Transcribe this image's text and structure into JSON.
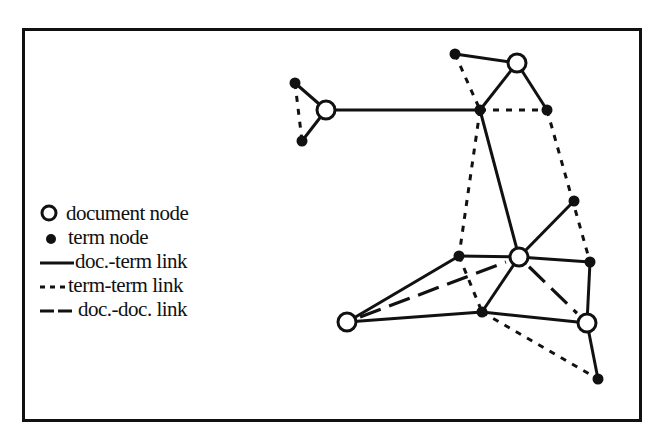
{
  "figure": {
    "type": "term-document graph",
    "legend": {
      "items": [
        {
          "symbol": "open-circle",
          "label": "document node"
        },
        {
          "symbol": "filled-dot",
          "label": "term node"
        },
        {
          "symbol": "solid-line",
          "label": "doc.-term link"
        },
        {
          "symbol": "short-dash-line",
          "label": "term-term link"
        },
        {
          "symbol": "long-dash-line",
          "label": "doc.-doc. link"
        }
      ]
    },
    "colors": {
      "ink": "#111111",
      "background": "#ffffff"
    },
    "nodes": [
      {
        "id": "d1",
        "kind": "document",
        "x": 326,
        "y": 110
      },
      {
        "id": "d2",
        "kind": "document",
        "x": 517,
        "y": 63
      },
      {
        "id": "d3",
        "kind": "document",
        "x": 519,
        "y": 257
      },
      {
        "id": "d4",
        "kind": "document",
        "x": 347,
        "y": 322
      },
      {
        "id": "d5",
        "kind": "document",
        "x": 587,
        "y": 323
      },
      {
        "id": "t1",
        "kind": "term",
        "x": 295,
        "y": 83
      },
      {
        "id": "t2",
        "kind": "term",
        "x": 302,
        "y": 141
      },
      {
        "id": "t3",
        "kind": "term",
        "x": 455,
        "y": 54
      },
      {
        "id": "t4",
        "kind": "term",
        "x": 480,
        "y": 110
      },
      {
        "id": "t5",
        "kind": "term",
        "x": 547,
        "y": 110
      },
      {
        "id": "t6",
        "kind": "term",
        "x": 574,
        "y": 201
      },
      {
        "id": "t7",
        "kind": "term",
        "x": 459,
        "y": 256
      },
      {
        "id": "t8",
        "kind": "term",
        "x": 590,
        "y": 262
      },
      {
        "id": "t9",
        "kind": "term",
        "x": 482,
        "y": 312
      },
      {
        "id": "t10",
        "kind": "term",
        "x": 598,
        "y": 379
      }
    ],
    "edges": [
      {
        "from": "d1",
        "to": "t1",
        "type": "doc-term"
      },
      {
        "from": "d1",
        "to": "t2",
        "type": "doc-term"
      },
      {
        "from": "d1",
        "to": "t4",
        "type": "doc-term"
      },
      {
        "from": "d2",
        "to": "t3",
        "type": "doc-term"
      },
      {
        "from": "d2",
        "to": "t4",
        "type": "doc-term"
      },
      {
        "from": "d2",
        "to": "t5",
        "type": "doc-term"
      },
      {
        "from": "d3",
        "to": "t4",
        "type": "doc-term"
      },
      {
        "from": "d3",
        "to": "t6",
        "type": "doc-term"
      },
      {
        "from": "d3",
        "to": "t7",
        "type": "doc-term"
      },
      {
        "from": "d3",
        "to": "t8",
        "type": "doc-term"
      },
      {
        "from": "d3",
        "to": "t9",
        "type": "doc-term"
      },
      {
        "from": "d4",
        "to": "t7",
        "type": "doc-term"
      },
      {
        "from": "d4",
        "to": "t9",
        "type": "doc-term"
      },
      {
        "from": "d5",
        "to": "t9",
        "type": "doc-term"
      },
      {
        "from": "d5",
        "to": "t8",
        "type": "doc-term"
      },
      {
        "from": "d5",
        "to": "t10",
        "type": "doc-term"
      },
      {
        "from": "t1",
        "to": "t2",
        "type": "term-term"
      },
      {
        "from": "t3",
        "to": "t4",
        "type": "term-term"
      },
      {
        "from": "t4",
        "to": "t5",
        "type": "term-term"
      },
      {
        "from": "t4",
        "to": "t7",
        "type": "term-term"
      },
      {
        "from": "t5",
        "to": "t8",
        "type": "term-term"
      },
      {
        "from": "t7",
        "to": "t9",
        "type": "term-term"
      },
      {
        "from": "t9",
        "to": "t10",
        "type": "term-term"
      },
      {
        "from": "d4",
        "to": "d3",
        "type": "doc-doc"
      },
      {
        "from": "d3",
        "to": "d5",
        "type": "doc-doc"
      }
    ]
  }
}
